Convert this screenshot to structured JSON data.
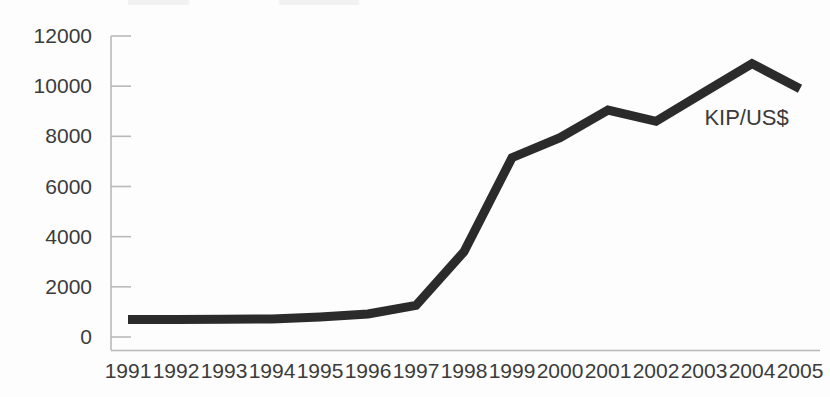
{
  "chart_data": {
    "type": "line",
    "title": "",
    "subtitle": "",
    "xlabel": "",
    "ylabel": "",
    "categories": [
      "1991",
      "1992",
      "1993",
      "1994",
      "1995",
      "1996",
      "1997",
      "1998",
      "1999",
      "2000",
      "2001",
      "2002",
      "2003",
      "2004",
      "2005"
    ],
    "series": [
      {
        "name": "KIP/US$",
        "values": [
          700,
          700,
          710,
          720,
          800,
          920,
          1260,
          3400,
          7150,
          7950,
          9050,
          8600,
          9750,
          10900,
          9900
        ]
      }
    ],
    "ylim": [
      0,
      12000
    ],
    "yticks": [
      0,
      2000,
      4000,
      6000,
      8000,
      10000,
      12000
    ],
    "ytick_labels": [
      "0",
      "2000",
      "4000",
      "6000",
      "8000",
      "10000",
      "12000"
    ],
    "xtick_labels": [
      "1991",
      "1992",
      "1993",
      "1994",
      "1995",
      "1996",
      "1997",
      "1998",
      "1999",
      "2000",
      "2001",
      "2002",
      "2003",
      "2004",
      "2005"
    ],
    "grid": false,
    "legend": "none",
    "annotations": [
      {
        "text": "KIP/US$",
        "x": 2004.3,
        "y": 8700,
        "name": "series-inline-label"
      }
    ],
    "colors": {
      "line": "#2b2b2b",
      "axis": "#b9b9b9",
      "tick_text": "#3b3b3b",
      "background": "#fdfdfd"
    },
    "line_width": 9
  }
}
